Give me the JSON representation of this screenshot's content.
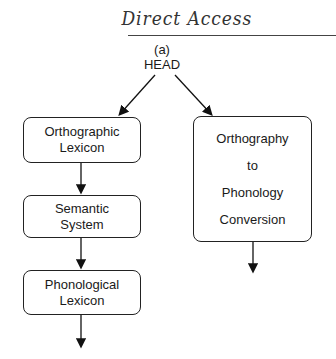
{
  "title": "Direct Access",
  "subfigure_label": "(a)",
  "root": "HEAD",
  "left_path": [
    {
      "line1": "Orthographic",
      "line2": "Lexicon"
    },
    {
      "line1": "Semantic",
      "line2": "System"
    },
    {
      "line1": "Phonological",
      "line2": "Lexicon"
    }
  ],
  "right_path": {
    "lines": [
      "Orthography",
      "to",
      "Phonology",
      "Conversion"
    ]
  }
}
